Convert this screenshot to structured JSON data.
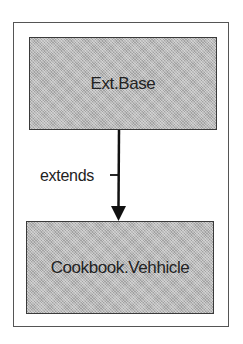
{
  "diagram": {
    "type": "class-inheritance",
    "nodes": [
      {
        "id": "base",
        "label": "Ext.Base"
      },
      {
        "id": "child",
        "label": "Cookbook.Vehhicle"
      }
    ],
    "edges": [
      {
        "from": "base",
        "to": "child",
        "label": "extends",
        "arrow": "to"
      }
    ],
    "colors": {
      "node_fill": "#b8b8b8",
      "node_border": "#3a3a3a",
      "frame_border": "#555555",
      "edge": "#111111"
    }
  }
}
